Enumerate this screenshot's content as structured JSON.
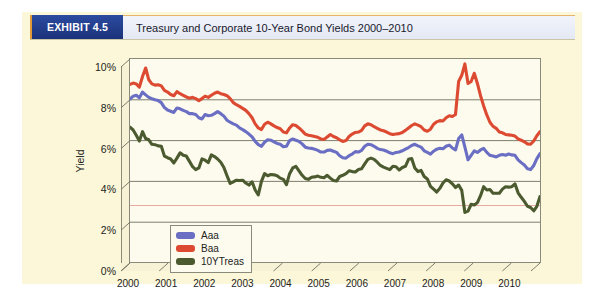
{
  "header": {
    "exhibit_tag": "EXHIBIT 4.5",
    "title": "Treasury and Corporate 10-Year Bond Yields 2000–2010",
    "tag_bg": "#1f3a8a",
    "tag_accent": "#e09a3a",
    "title_bg": "#e7ecf6"
  },
  "page": {
    "background": "#fbf7d8",
    "plot_background": "#fdfbee"
  },
  "chart_data": {
    "type": "line",
    "title": "Treasury and Corporate 10-Year Bond Yields 2000–2010",
    "xlabel": "",
    "ylabel": "Yield",
    "ylim": [
      0,
      10
    ],
    "xlim": [
      2000.0,
      2010.75
    ],
    "ytick_labels": [
      "0%",
      "2%",
      "4%",
      "6%",
      "8%",
      "10%"
    ],
    "ytick_values": [
      0,
      2,
      4,
      6,
      8,
      10
    ],
    "xtick_labels": [
      "2000",
      "2001",
      "2002",
      "2003",
      "2004",
      "2005",
      "2006",
      "2007",
      "2008",
      "2009",
      "2010"
    ],
    "xtick_values": [
      2000,
      2001,
      2002,
      2003,
      2004,
      2005,
      2006,
      2007,
      2008,
      2009,
      2010
    ],
    "grid": true,
    "grid_axis": "y",
    "legend_position": "inside-lower-left",
    "y_unit": "percent",
    "series": [
      {
        "name": "Aaa",
        "color": "#6b6fc4",
        "values": [
          8.04,
          8.18,
          8.22,
          8.1,
          8.38,
          8.24,
          8.12,
          8.05,
          8.0,
          7.96,
          7.86,
          7.62,
          7.5,
          7.44,
          7.38,
          7.6,
          7.56,
          7.48,
          7.42,
          7.32,
          7.32,
          7.28,
          7.12,
          7.06,
          7.28,
          7.22,
          7.24,
          7.32,
          7.42,
          7.32,
          7.2,
          7.0,
          6.9,
          6.82,
          6.76,
          6.62,
          6.54,
          6.44,
          6.32,
          6.18,
          5.96,
          5.8,
          5.72,
          5.92,
          6.04,
          6.02,
          5.94,
          5.86,
          5.82,
          5.7,
          5.72,
          6.0,
          6.08,
          6.02,
          5.96,
          5.84,
          5.68,
          5.64,
          5.62,
          5.58,
          5.52,
          5.44,
          5.44,
          5.52,
          5.54,
          5.48,
          5.42,
          5.26,
          5.16,
          5.14,
          5.26,
          5.34,
          5.46,
          5.44,
          5.52,
          5.72,
          5.82,
          5.8,
          5.72,
          5.62,
          5.56,
          5.54,
          5.48,
          5.4,
          5.36,
          5.42,
          5.44,
          5.5,
          5.58,
          5.66,
          5.76,
          5.82,
          5.74,
          5.68,
          5.5,
          5.42,
          5.34,
          5.48,
          5.58,
          5.62,
          5.6,
          5.72,
          5.78,
          5.64,
          5.54,
          6.1,
          6.28,
          5.68,
          5.06,
          5.28,
          5.5,
          5.42,
          5.54,
          5.62,
          5.42,
          5.28,
          5.24,
          5.2,
          5.28,
          5.32,
          5.28,
          5.34,
          5.3,
          5.28,
          5.06,
          4.92,
          4.8,
          4.62,
          4.58,
          4.78,
          5.12,
          5.36
        ]
      },
      {
        "name": "Baa",
        "color": "#dc4a32",
        "values": [
          8.76,
          8.82,
          8.78,
          8.62,
          9.14,
          9.56,
          8.98,
          8.78,
          8.72,
          8.74,
          8.68,
          8.46,
          8.38,
          8.26,
          8.2,
          8.4,
          8.3,
          8.22,
          8.14,
          8.08,
          8.12,
          8.06,
          7.96,
          8.06,
          8.18,
          8.12,
          8.22,
          8.32,
          8.38,
          8.3,
          8.26,
          8.2,
          8.06,
          7.86,
          7.76,
          7.68,
          7.58,
          7.48,
          7.32,
          7.12,
          6.82,
          6.62,
          6.54,
          6.8,
          6.9,
          6.82,
          6.72,
          6.64,
          6.58,
          6.42,
          6.38,
          6.62,
          6.78,
          6.74,
          6.62,
          6.48,
          6.32,
          6.26,
          6.24,
          6.2,
          6.16,
          6.08,
          6.06,
          6.18,
          6.3,
          6.2,
          6.14,
          6.04,
          5.96,
          6.0,
          6.2,
          6.32,
          6.4,
          6.42,
          6.5,
          6.72,
          6.82,
          6.78,
          6.68,
          6.6,
          6.52,
          6.48,
          6.42,
          6.34,
          6.3,
          6.32,
          6.34,
          6.4,
          6.5,
          6.62,
          6.74,
          6.82,
          6.76,
          6.68,
          6.52,
          6.46,
          6.56,
          6.8,
          6.92,
          6.98,
          6.96,
          7.12,
          7.22,
          7.18,
          7.28,
          8.9,
          9.2,
          9.76,
          8.8,
          8.9,
          9.3,
          8.8,
          8.2,
          7.7,
          7.26,
          6.9,
          6.7,
          6.6,
          6.42,
          6.38,
          6.3,
          6.28,
          6.26,
          6.22,
          6.08,
          6.02,
          5.94,
          5.84,
          5.82,
          5.98,
          6.24,
          6.44
        ]
      },
      {
        "name": "10YTreas",
        "color": "#4c5a30",
        "values": [
          6.66,
          6.52,
          6.26,
          5.98,
          6.44,
          6.1,
          6.04,
          5.82,
          5.8,
          5.74,
          5.72,
          5.24,
          5.16,
          5.1,
          4.9,
          5.14,
          5.4,
          5.28,
          5.24,
          4.98,
          4.72,
          4.58,
          4.66,
          5.1,
          5.04,
          4.92,
          5.3,
          5.22,
          5.1,
          4.94,
          4.68,
          4.28,
          3.9,
          3.98,
          4.06,
          4.04,
          4.06,
          3.92,
          3.82,
          3.98,
          3.58,
          3.34,
          4.0,
          4.38,
          4.28,
          4.34,
          4.32,
          4.28,
          4.16,
          4.1,
          3.84,
          4.38,
          4.66,
          4.74,
          4.52,
          4.3,
          4.14,
          4.1,
          4.2,
          4.22,
          4.26,
          4.2,
          4.18,
          4.3,
          4.16,
          4.04,
          4.02,
          4.24,
          4.3,
          4.38,
          4.52,
          4.48,
          4.46,
          4.58,
          4.62,
          4.86,
          5.08,
          5.14,
          5.08,
          4.94,
          4.78,
          4.7,
          4.64,
          4.58,
          4.74,
          4.72,
          4.56,
          4.68,
          4.74,
          5.08,
          5.12,
          4.66,
          4.48,
          4.54,
          4.24,
          4.12,
          3.76,
          3.62,
          3.48,
          3.66,
          3.92,
          4.08,
          4.02,
          3.88,
          3.7,
          3.82,
          3.56,
          2.48,
          2.54,
          2.88,
          2.84,
          2.96,
          3.3,
          3.74,
          3.58,
          3.6,
          3.42,
          3.42,
          3.42,
          3.62,
          3.74,
          3.72,
          3.74,
          3.88,
          3.44,
          3.22,
          3.02,
          2.78,
          2.72,
          2.56,
          2.78,
          3.26
        ]
      }
    ],
    "annotations": [
      {
        "label": "Baa crisis peak",
        "x": 2008.92,
        "y": 9.76
      },
      {
        "label": "10YTreas crisis trough",
        "x": 2008.92,
        "y": 2.48
      }
    ]
  },
  "legend": {
    "items": [
      {
        "label": "Aaa",
        "color": "#6b6fc4"
      },
      {
        "label": "Baa",
        "color": "#dc4a32"
      },
      {
        "label": "10YTreas",
        "color": "#4c5a30"
      }
    ]
  }
}
